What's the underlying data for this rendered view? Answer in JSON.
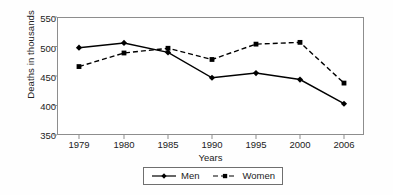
{
  "chart_data": {
    "type": "line",
    "title": "",
    "xlabel": "Years",
    "ylabel": "Deaths in thousands",
    "categories": [
      "1979",
      "1980",
      "1985",
      "1990",
      "1995",
      "2000",
      "2006"
    ],
    "ylim": [
      350,
      550
    ],
    "yticks": [
      350,
      400,
      450,
      500,
      550
    ],
    "grid": false,
    "legend_position": "bottom",
    "series": [
      {
        "name": "Men",
        "marker": "diamond",
        "linestyle": "solid",
        "color": "#000000",
        "values": [
          498,
          506,
          490,
          447,
          455,
          444,
          403
        ]
      },
      {
        "name": "Women",
        "marker": "square",
        "linestyle": "dashed",
        "color": "#000000",
        "values": [
          466,
          489,
          497,
          478,
          504,
          507,
          438
        ]
      }
    ]
  },
  "axis": {
    "y_tick_labels": [
      "550",
      "500",
      "450",
      "400",
      "350"
    ],
    "x_tick_labels": [
      "1979",
      "1980",
      "1985",
      "1990",
      "1995",
      "2000",
      "2006"
    ],
    "y_axis_title": "Deaths in thousands",
    "x_axis_title": "Years"
  },
  "legend": {
    "entries": [
      {
        "label": "Men"
      },
      {
        "label": "Women"
      }
    ]
  }
}
